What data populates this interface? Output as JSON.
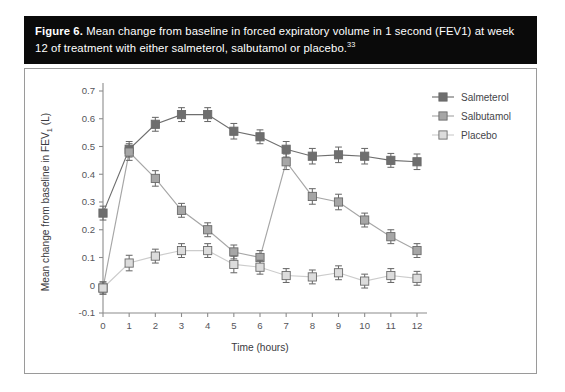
{
  "figure": {
    "label": "Figure 6.",
    "caption": " Mean change from baseline in forced expiratory volume in 1 second (FEV1) at week 12 of treatment with either salmeterol, salbutamol or placebo.",
    "reference": "33"
  },
  "colors": {
    "salmeterol": "#6e6e6e",
    "salbutamol": "#a6a6a6",
    "placebo": "#dcdcdc",
    "marker_edge": "#6a6a6a",
    "axis": "#8c8c8c",
    "text": "#55555a",
    "caption_bg": "#0a0a0a",
    "panel_border": "#9a9a9a"
  },
  "chart_data": {
    "type": "line",
    "title": "",
    "xlabel": "Time (hours)",
    "ylabel": "Mean change from baseline in FEV1 (L)",
    "ylabel_parts": {
      "pre": "Mean change from baseline in FEV",
      "sub": "1",
      "post": " (L)"
    },
    "x": [
      0,
      1,
      2,
      3,
      4,
      5,
      6,
      7,
      8,
      9,
      10,
      11,
      12
    ],
    "xticklabels": [
      "0",
      "1",
      "2",
      "3",
      "4",
      "5",
      "6",
      "7",
      "8",
      "9",
      "10",
      "11",
      "12"
    ],
    "yticks": [
      -0.1,
      0,
      0.1,
      0.2,
      0.3,
      0.4,
      0.5,
      0.6,
      0.7
    ],
    "yticklabels": [
      "-0.1",
      "0",
      "0.1",
      "0.2",
      "0.3",
      "0.4",
      "0.5",
      "0.6",
      "0.7"
    ],
    "xlim": [
      0,
      12
    ],
    "ylim": [
      -0.1,
      0.7
    ],
    "grid": false,
    "legend_position": "right",
    "series": [
      {
        "name": "Salmeterol",
        "color_key": "salmeterol",
        "values": [
          0.26,
          0.49,
          0.58,
          0.615,
          0.615,
          0.555,
          0.535,
          0.49,
          0.465,
          0.47,
          0.465,
          0.45,
          0.445
        ],
        "errors": [
          0.025,
          0.028,
          0.025,
          0.025,
          0.025,
          0.028,
          0.025,
          0.028,
          0.028,
          0.028,
          0.028,
          0.025,
          0.028
        ]
      },
      {
        "name": "Salbutamol",
        "color_key": "salbutamol",
        "values": [
          -0.01,
          0.48,
          0.385,
          0.27,
          0.2,
          0.12,
          0.1,
          0.445,
          0.32,
          0.3,
          0.235,
          0.175,
          0.125
        ],
        "errors": [
          0.022,
          0.03,
          0.028,
          0.025,
          0.025,
          0.025,
          0.025,
          0.028,
          0.028,
          0.028,
          0.025,
          0.025,
          0.025
        ]
      },
      {
        "name": "Placebo",
        "color_key": "placebo",
        "values": [
          -0.01,
          0.08,
          0.105,
          0.125,
          0.125,
          0.075,
          0.065,
          0.035,
          0.03,
          0.045,
          0.015,
          0.035,
          0.025
        ],
        "errors": [
          0.022,
          0.028,
          0.025,
          0.025,
          0.025,
          0.03,
          0.025,
          0.025,
          0.025,
          0.025,
          0.025,
          0.025,
          0.025
        ]
      }
    ]
  }
}
